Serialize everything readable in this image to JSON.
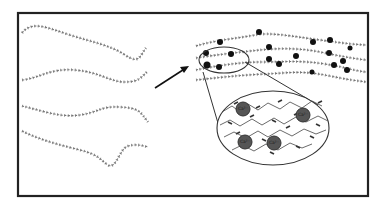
{
  "diagram": {
    "left_panel": {
      "label": "free polymer chains",
      "chain_count": 4
    },
    "arrow": {
      "direction": "up-right"
    },
    "right_panel": {
      "label": "cross-linked polymer network with ions",
      "ion_count": 18,
      "magnified_view": {
        "ion_label": "Ca²⁺",
        "ion_count": 4
      }
    },
    "colors": {
      "frame": "#222222",
      "chain": "#777777",
      "ion": "#111111",
      "ion_magnified": "#555555",
      "background": "#ffffff"
    }
  }
}
